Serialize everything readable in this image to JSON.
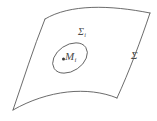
{
  "figure": {
    "background_color": "#ffffff",
    "stroke_color": "#5a5a5a",
    "label_color": "#4a4a4a",
    "point_color": "#3a3a3a",
    "width": 157,
    "height": 121
  },
  "labels": {
    "surface_outer": {
      "symbol": "Σ",
      "subscript": "",
      "name": "surface-sigma-label"
    },
    "surface_subregion": {
      "symbol": "Σ",
      "subscript": "i",
      "name": "subregion-sigma-i-label"
    },
    "point": {
      "symbol": "M",
      "subscript": "i",
      "name": "point-m-i-label"
    }
  },
  "geometry": {
    "surface_patch": {
      "type": "curved-quadrilateral",
      "corners": [
        {
          "id": "top-left",
          "x": 45,
          "y": 19
        },
        {
          "id": "top-right",
          "x": 150,
          "y": 13
        },
        {
          "id": "bottom-right",
          "x": 117,
          "y": 98
        },
        {
          "id": "bottom-left",
          "x": 13,
          "y": 110
        }
      ],
      "edges": [
        {
          "id": "top-edge",
          "curvature": "arched-upward"
        },
        {
          "id": "right-edge",
          "curvature": "slightly-concave"
        },
        {
          "id": "bottom-edge",
          "curvature": "arched-upward"
        },
        {
          "id": "left-edge",
          "curvature": "slightly-convex"
        }
      ]
    },
    "subregion": {
      "type": "ellipse",
      "center_x": 70,
      "center_y": 58,
      "radius_x": 19,
      "radius_y": 13,
      "rotation_deg": -34
    },
    "marked_point": {
      "x": 63.5,
      "y": 59,
      "radius": 1.5
    }
  }
}
